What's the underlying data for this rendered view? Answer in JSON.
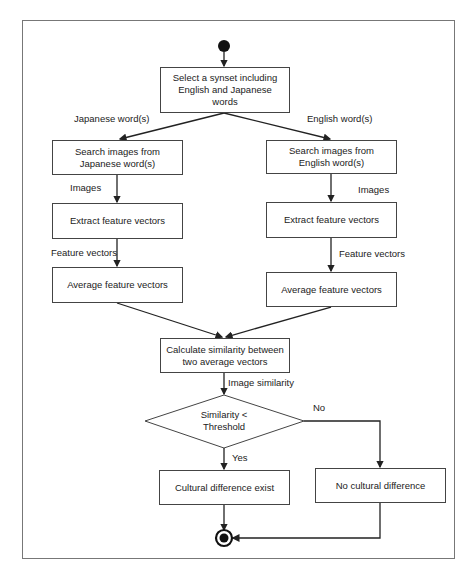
{
  "diagram": {
    "type": "activity-flowchart",
    "nodes": {
      "select_synset": "Select a synset including English and Japanese words",
      "jp_search": "Search images from Japanese word(s)",
      "jp_extract": "Extract feature vectors",
      "jp_average": "Average feature vectors",
      "en_search": "Search images from English word(s)",
      "en_extract": "Extract feature vectors",
      "en_average": "Average feature vectors",
      "calculate": "Calculate similarity between two average vectors",
      "decision": "Similarity < Threshold",
      "diff_exist": "Cultural difference exist",
      "no_diff": "No cultural difference"
    },
    "edge_labels": {
      "japanese_words": "Japanese word(s)",
      "english_words": "English word(s)",
      "jp_images": "Images",
      "en_images": "Images",
      "jp_feature_vectors": "Feature vectors",
      "en_feature_vectors": "Feature vectors",
      "image_similarity": "Image similarity",
      "yes": "Yes",
      "no": "No"
    },
    "colors": {
      "line": "#333333",
      "frame": "#777777",
      "node_fill": "#ffffff",
      "start_end_fill": "#111111"
    }
  }
}
